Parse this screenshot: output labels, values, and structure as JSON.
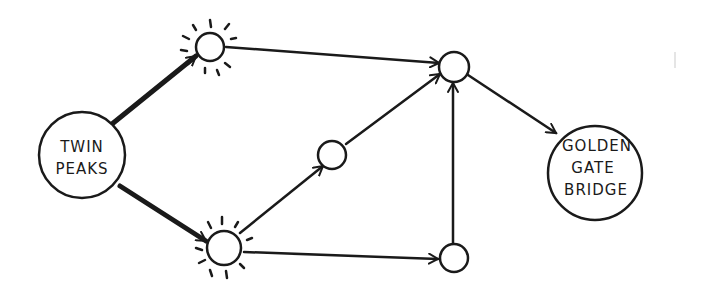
{
  "diagram": {
    "type": "directed-graph",
    "style": "hand-drawn",
    "colors": {
      "ink": "#1a1a1a",
      "background": "#ffffff"
    },
    "nodes": [
      {
        "id": "start",
        "label_lines": [
          "TWIN",
          "PEAKS"
        ],
        "role": "start"
      },
      {
        "id": "a",
        "label_lines": [],
        "highlighted": true
      },
      {
        "id": "b",
        "label_lines": [],
        "highlighted": true
      },
      {
        "id": "c",
        "label_lines": []
      },
      {
        "id": "d",
        "label_lines": []
      },
      {
        "id": "e",
        "label_lines": []
      },
      {
        "id": "end",
        "label_lines": [
          "GOLDEN",
          "GATE",
          "BRIDGE"
        ],
        "role": "end"
      }
    ],
    "edges": [
      {
        "from": "start",
        "to": "a",
        "bold": true
      },
      {
        "from": "start",
        "to": "b",
        "bold": true
      },
      {
        "from": "a",
        "to": "d"
      },
      {
        "from": "b",
        "to": "c"
      },
      {
        "from": "b",
        "to": "e"
      },
      {
        "from": "c",
        "to": "d"
      },
      {
        "from": "e",
        "to": "d"
      },
      {
        "from": "d",
        "to": "end"
      }
    ]
  }
}
